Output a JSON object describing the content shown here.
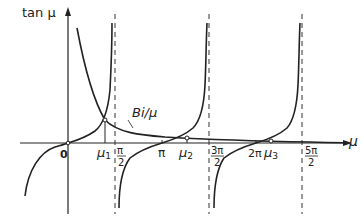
{
  "figure": {
    "y_axis_label": "tan μ",
    "x_axis_label": "μ",
    "curve_label": "Bi/μ",
    "origin_label": "0",
    "ticks": [
      {
        "id": "mu1",
        "label": "μ",
        "sub": "1"
      },
      {
        "id": "pi_half",
        "num": "π",
        "den": "2"
      },
      {
        "id": "pi",
        "label": "π"
      },
      {
        "id": "mu2",
        "label": "μ",
        "sub": "2"
      },
      {
        "id": "three_pi_half",
        "num": "3π",
        "den": "2"
      },
      {
        "id": "two_pi",
        "label": "2π"
      },
      {
        "id": "mu3",
        "label": "μ",
        "sub": "3"
      },
      {
        "id": "five_pi_half",
        "num": "5π",
        "den": "2"
      }
    ],
    "colors": {
      "line": "#222222",
      "background": "#ffffff"
    }
  }
}
